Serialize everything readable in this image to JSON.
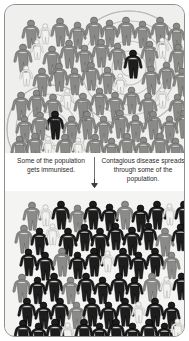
{
  "frame": {
    "border_color": "#8e8e8e",
    "background": "#f3f3f1"
  },
  "captions": {
    "left": "Some of the population gets immunised.",
    "right": "Contagious disease spreads through some of the population.",
    "divider_icon": "vertical-divider",
    "arrow_icon": "arrow-down-icon"
  },
  "legend_colors": {
    "unvaccinated": "#8a8a88",
    "immunised": "#f2f2f0",
    "infected": "#1d1d1d",
    "ripple": "#b8b8b6"
  },
  "panels": [
    {
      "id": "top",
      "name": "before-immunisation-crowd",
      "description": "Crowd of mostly grey unvaccinated figures with a few white immunised figures and two dark infected figures emitting contagion ripples.",
      "ripple_centers": [
        {
          "cx": 124,
          "cy": 63,
          "radii": [
            8,
            17,
            27,
            37,
            47,
            57
          ]
        },
        {
          "cx": 46,
          "cy": 124,
          "radii": [
            8,
            17,
            26,
            35,
            44
          ]
        }
      ],
      "counts": {
        "unvaccinated": 46,
        "immunised": 9,
        "infected": 2
      },
      "figures": [
        {
          "x": 16,
          "y": 14,
          "s": 1.0,
          "c": "unvaccinated"
        },
        {
          "x": 33,
          "y": 18,
          "s": 0.72,
          "c": "immunised"
        },
        {
          "x": 45,
          "y": 12,
          "s": 1.0,
          "c": "unvaccinated"
        },
        {
          "x": 63,
          "y": 16,
          "s": 0.95,
          "c": "unvaccinated"
        },
        {
          "x": 79,
          "y": 11,
          "s": 1.0,
          "c": "unvaccinated"
        },
        {
          "x": 95,
          "y": 14,
          "s": 0.95,
          "c": "unvaccinated"
        },
        {
          "x": 111,
          "y": 11,
          "s": 1.0,
          "c": "unvaccinated"
        },
        {
          "x": 128,
          "y": 15,
          "s": 0.95,
          "c": "unvaccinated"
        },
        {
          "x": 145,
          "y": 11,
          "s": 1.0,
          "c": "unvaccinated"
        },
        {
          "x": 162,
          "y": 17,
          "s": 0.95,
          "c": "unvaccinated"
        },
        {
          "x": 8,
          "y": 38,
          "s": 1.0,
          "c": "unvaccinated"
        },
        {
          "x": 25,
          "y": 34,
          "s": 0.7,
          "c": "immunised"
        },
        {
          "x": 37,
          "y": 40,
          "s": 1.0,
          "c": "unvaccinated"
        },
        {
          "x": 54,
          "y": 34,
          "s": 1.0,
          "c": "unvaccinated"
        },
        {
          "x": 70,
          "y": 39,
          "s": 0.95,
          "c": "unvaccinated"
        },
        {
          "x": 86,
          "y": 33,
          "s": 1.0,
          "c": "unvaccinated"
        },
        {
          "x": 103,
          "y": 37,
          "s": 0.95,
          "c": "unvaccinated"
        },
        {
          "x": 118,
          "y": 44,
          "s": 1.0,
          "c": "infected"
        },
        {
          "x": 135,
          "y": 35,
          "s": 0.95,
          "c": "unvaccinated"
        },
        {
          "x": 150,
          "y": 32,
          "s": 0.72,
          "c": "immunised"
        },
        {
          "x": 163,
          "y": 38,
          "s": 1.0,
          "c": "unvaccinated"
        },
        {
          "x": 14,
          "y": 60,
          "s": 0.72,
          "c": "immunised"
        },
        {
          "x": 27,
          "y": 62,
          "s": 1.0,
          "c": "unvaccinated"
        },
        {
          "x": 44,
          "y": 57,
          "s": 1.0,
          "c": "unvaccinated"
        },
        {
          "x": 60,
          "y": 62,
          "s": 0.95,
          "c": "unvaccinated"
        },
        {
          "x": 76,
          "y": 56,
          "s": 1.0,
          "c": "unvaccinated"
        },
        {
          "x": 93,
          "y": 61,
          "s": 0.95,
          "c": "unvaccinated"
        },
        {
          "x": 108,
          "y": 68,
          "s": 0.72,
          "c": "immunised"
        },
        {
          "x": 136,
          "y": 60,
          "s": 1.0,
          "c": "unvaccinated"
        },
        {
          "x": 152,
          "y": 56,
          "s": 0.95,
          "c": "unvaccinated"
        },
        {
          "x": 167,
          "y": 62,
          "s": 1.0,
          "c": "unvaccinated"
        },
        {
          "x": 6,
          "y": 86,
          "s": 1.0,
          "c": "unvaccinated"
        },
        {
          "x": 22,
          "y": 84,
          "s": 0.95,
          "c": "unvaccinated"
        },
        {
          "x": 38,
          "y": 88,
          "s": 1.0,
          "c": "unvaccinated"
        },
        {
          "x": 55,
          "y": 83,
          "s": 0.72,
          "c": "immunised"
        },
        {
          "x": 68,
          "y": 87,
          "s": 1.0,
          "c": "unvaccinated"
        },
        {
          "x": 85,
          "y": 82,
          "s": 0.95,
          "c": "unvaccinated"
        },
        {
          "x": 100,
          "y": 86,
          "s": 1.0,
          "c": "unvaccinated"
        },
        {
          "x": 117,
          "y": 81,
          "s": 0.95,
          "c": "unvaccinated"
        },
        {
          "x": 133,
          "y": 87,
          "s": 1.0,
          "c": "unvaccinated"
        },
        {
          "x": 150,
          "y": 82,
          "s": 0.72,
          "c": "immunised"
        },
        {
          "x": 163,
          "y": 88,
          "s": 0.95,
          "c": "unvaccinated"
        },
        {
          "x": 40,
          "y": 105,
          "s": 1.0,
          "c": "infected"
        },
        {
          "x": 10,
          "y": 110,
          "s": 0.95,
          "c": "unvaccinated"
        },
        {
          "x": 25,
          "y": 106,
          "s": 1.0,
          "c": "unvaccinated"
        },
        {
          "x": 57,
          "y": 110,
          "s": 0.95,
          "c": "unvaccinated"
        },
        {
          "x": 72,
          "y": 105,
          "s": 1.0,
          "c": "unvaccinated"
        },
        {
          "x": 89,
          "y": 110,
          "s": 0.95,
          "c": "unvaccinated"
        },
        {
          "x": 105,
          "y": 104,
          "s": 1.0,
          "c": "unvaccinated"
        },
        {
          "x": 121,
          "y": 109,
          "s": 0.95,
          "c": "unvaccinated"
        },
        {
          "x": 138,
          "y": 105,
          "s": 1.0,
          "c": "unvaccinated"
        },
        {
          "x": 155,
          "y": 110,
          "s": 0.95,
          "c": "unvaccinated"
        },
        {
          "x": 169,
          "y": 104,
          "s": 1.0,
          "c": "unvaccinated"
        },
        {
          "x": 5,
          "y": 130,
          "s": 0.95,
          "c": "unvaccinated"
        },
        {
          "x": 20,
          "y": 127,
          "s": 1.0,
          "c": "unvaccinated"
        },
        {
          "x": 36,
          "y": 131,
          "s": 0.7,
          "c": "immunised"
        },
        {
          "x": 50,
          "y": 128,
          "s": 1.0,
          "c": "unvaccinated"
        },
        {
          "x": 66,
          "y": 132,
          "s": 0.72,
          "c": "immunised"
        },
        {
          "x": 80,
          "y": 128,
          "s": 1.0,
          "c": "unvaccinated"
        },
        {
          "x": 97,
          "y": 132,
          "s": 0.95,
          "c": "unvaccinated"
        },
        {
          "x": 112,
          "y": 127,
          "s": 1.0,
          "c": "unvaccinated"
        },
        {
          "x": 129,
          "y": 131,
          "s": 0.95,
          "c": "unvaccinated"
        },
        {
          "x": 145,
          "y": 127,
          "s": 1.0,
          "c": "unvaccinated"
        },
        {
          "x": 161,
          "y": 132,
          "s": 0.95,
          "c": "unvaccinated"
        }
      ]
    },
    {
      "id": "bottom",
      "name": "after-spread-crowd",
      "description": "Crowd where most figures are dark infected, with scattered grey and pale immunised figures.",
      "counts": {
        "infected": 38,
        "unvaccinated": 16,
        "immunised": 9
      },
      "figures": [
        {
          "x": 17,
          "y": 10,
          "s": 1.0,
          "c": "unvaccinated"
        },
        {
          "x": 33,
          "y": 13,
          "s": 0.75,
          "c": "immunised"
        },
        {
          "x": 46,
          "y": 9,
          "s": 1.0,
          "c": "infected"
        },
        {
          "x": 63,
          "y": 13,
          "s": 0.95,
          "c": "unvaccinated"
        },
        {
          "x": 78,
          "y": 9,
          "s": 1.0,
          "c": "infected"
        },
        {
          "x": 95,
          "y": 12,
          "s": 0.95,
          "c": "infected"
        },
        {
          "x": 110,
          "y": 9,
          "s": 1.0,
          "c": "unvaccinated"
        },
        {
          "x": 126,
          "y": 13,
          "s": 0.95,
          "c": "infected"
        },
        {
          "x": 142,
          "y": 9,
          "s": 1.0,
          "c": "infected"
        },
        {
          "x": 157,
          "y": 12,
          "s": 0.75,
          "c": "immunised"
        },
        {
          "x": 169,
          "y": 9,
          "s": 1.0,
          "c": "infected"
        },
        {
          "x": 9,
          "y": 33,
          "s": 1.0,
          "c": "unvaccinated"
        },
        {
          "x": 25,
          "y": 36,
          "s": 0.95,
          "c": "infected"
        },
        {
          "x": 40,
          "y": 32,
          "s": 0.75,
          "c": "immunised"
        },
        {
          "x": 53,
          "y": 36,
          "s": 1.0,
          "c": "infected"
        },
        {
          "x": 70,
          "y": 32,
          "s": 0.95,
          "c": "infected"
        },
        {
          "x": 85,
          "y": 36,
          "s": 1.0,
          "c": "infected"
        },
        {
          "x": 101,
          "y": 31,
          "s": 0.95,
          "c": "infected"
        },
        {
          "x": 117,
          "y": 35,
          "s": 1.0,
          "c": "infected"
        },
        {
          "x": 134,
          "y": 31,
          "s": 0.95,
          "c": "infected"
        },
        {
          "x": 150,
          "y": 36,
          "s": 1.0,
          "c": "unvaccinated"
        },
        {
          "x": 166,
          "y": 32,
          "s": 0.95,
          "c": "infected"
        },
        {
          "x": 14,
          "y": 57,
          "s": 0.95,
          "c": "infected"
        },
        {
          "x": 30,
          "y": 60,
          "s": 1.0,
          "c": "infected"
        },
        {
          "x": 47,
          "y": 56,
          "s": 1.0,
          "c": "unvaccinated"
        },
        {
          "x": 63,
          "y": 60,
          "s": 0.95,
          "c": "infected"
        },
        {
          "x": 79,
          "y": 56,
          "s": 1.0,
          "c": "infected"
        },
        {
          "x": 95,
          "y": 59,
          "s": 0.75,
          "c": "immunised"
        },
        {
          "x": 108,
          "y": 56,
          "s": 1.0,
          "c": "infected"
        },
        {
          "x": 124,
          "y": 60,
          "s": 0.95,
          "c": "infected"
        },
        {
          "x": 140,
          "y": 56,
          "s": 1.0,
          "c": "infected"
        },
        {
          "x": 157,
          "y": 60,
          "s": 0.95,
          "c": "unvaccinated"
        },
        {
          "x": 7,
          "y": 82,
          "s": 1.0,
          "c": "unvaccinated"
        },
        {
          "x": 23,
          "y": 85,
          "s": 0.95,
          "c": "infected"
        },
        {
          "x": 39,
          "y": 81,
          "s": 1.0,
          "c": "infected"
        },
        {
          "x": 56,
          "y": 85,
          "s": 0.95,
          "c": "unvaccinated"
        },
        {
          "x": 71,
          "y": 81,
          "s": 1.0,
          "c": "infected"
        },
        {
          "x": 88,
          "y": 85,
          "s": 0.95,
          "c": "infected"
        },
        {
          "x": 104,
          "y": 81,
          "s": 1.0,
          "c": "infected"
        },
        {
          "x": 120,
          "y": 85,
          "s": 0.95,
          "c": "infected"
        },
        {
          "x": 137,
          "y": 81,
          "s": 1.0,
          "c": "unvaccinated"
        },
        {
          "x": 154,
          "y": 85,
          "s": 0.75,
          "c": "immunised"
        },
        {
          "x": 167,
          "y": 81,
          "s": 0.95,
          "c": "infected"
        },
        {
          "x": 12,
          "y": 106,
          "s": 1.0,
          "c": "infected"
        },
        {
          "x": 29,
          "y": 110,
          "s": 0.95,
          "c": "infected"
        },
        {
          "x": 45,
          "y": 106,
          "s": 1.0,
          "c": "infected"
        },
        {
          "x": 62,
          "y": 110,
          "s": 0.95,
          "c": "unvaccinated"
        },
        {
          "x": 77,
          "y": 106,
          "s": 1.0,
          "c": "infected"
        },
        {
          "x": 94,
          "y": 110,
          "s": 0.95,
          "c": "infected"
        },
        {
          "x": 110,
          "y": 106,
          "s": 1.0,
          "c": "infected"
        },
        {
          "x": 126,
          "y": 110,
          "s": 0.75,
          "c": "immunised"
        },
        {
          "x": 140,
          "y": 106,
          "s": 1.0,
          "c": "infected"
        },
        {
          "x": 157,
          "y": 110,
          "s": 0.95,
          "c": "infected"
        },
        {
          "x": 8,
          "y": 128,
          "s": 1.0,
          "c": "infected"
        },
        {
          "x": 24,
          "y": 131,
          "s": 0.95,
          "c": "infected"
        },
        {
          "x": 40,
          "y": 127,
          "s": 1.0,
          "c": "infected"
        },
        {
          "x": 55,
          "y": 131,
          "s": 0.75,
          "c": "immunised"
        },
        {
          "x": 69,
          "y": 127,
          "s": 1.0,
          "c": "infected"
        },
        {
          "x": 85,
          "y": 131,
          "s": 0.95,
          "c": "infected"
        },
        {
          "x": 101,
          "y": 127,
          "s": 1.0,
          "c": "infected"
        },
        {
          "x": 118,
          "y": 131,
          "s": 0.95,
          "c": "infected"
        },
        {
          "x": 134,
          "y": 127,
          "s": 1.0,
          "c": "infected"
        },
        {
          "x": 150,
          "y": 131,
          "s": 0.95,
          "c": "infected"
        },
        {
          "x": 165,
          "y": 127,
          "s": 0.75,
          "c": "immunised"
        }
      ]
    }
  ]
}
